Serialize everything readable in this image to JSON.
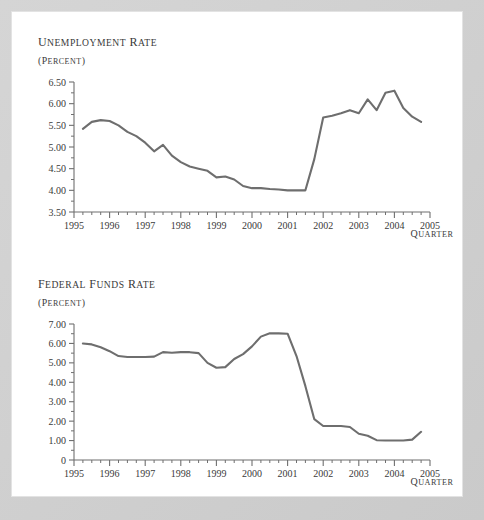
{
  "figure": {
    "background_color": "#cfcfcf",
    "sheet_color": "#ffffff",
    "line_color": "#6e6e6e",
    "axis_color": "#6f6f6f",
    "text_color": "#3a3a3a"
  },
  "chart_data": [
    {
      "id": "unemployment",
      "type": "line",
      "title": "Unemployment rate",
      "subtitle": "(percent)",
      "xlabel": "Quarter",
      "ylabel": "",
      "ylim": [
        3.5,
        6.5
      ],
      "xlim": [
        1995.25,
        2005.0
      ],
      "grid": false,
      "legend": "none",
      "ytick_labels": [
        "6.50",
        "6.00",
        "5.50",
        "5.00",
        "4.50",
        "4.00",
        "3.50"
      ],
      "ytick_values": [
        6.5,
        6.0,
        5.5,
        5.0,
        4.5,
        4.0,
        3.5
      ],
      "ytick_minor_step": 0.25,
      "xtick_labels": [
        "1995",
        "1996",
        "1997",
        "1998",
        "1999",
        "2000",
        "2001",
        "2002",
        "2003",
        "2004",
        "2005"
      ],
      "xtick_values": [
        1995,
        1996,
        1997,
        1998,
        1999,
        2000,
        2001,
        2002,
        2003,
        2004,
        2005
      ],
      "xtick_minor_step": 0.25,
      "x": [
        1995.25,
        1995.5,
        1995.75,
        1996.0,
        1996.25,
        1996.5,
        1996.75,
        1997.0,
        1997.25,
        1997.5,
        1997.75,
        1998.0,
        1998.25,
        1998.5,
        1998.75,
        1999.0,
        1999.25,
        1999.5,
        1999.75,
        2000.0,
        2000.25,
        2000.5,
        2000.75,
        2001.0,
        2001.25,
        2001.5,
        2001.75,
        2002.0,
        2002.25,
        2002.5,
        2002.75,
        2003.0,
        2003.25,
        2003.5,
        2003.75,
        2004.0,
        2004.25,
        2004.5,
        2004.75
      ],
      "values": [
        5.42,
        5.58,
        5.62,
        5.6,
        5.5,
        5.35,
        5.25,
        5.1,
        4.9,
        5.05,
        4.8,
        4.65,
        4.55,
        4.5,
        4.45,
        4.3,
        4.32,
        4.25,
        4.1,
        4.05,
        4.05,
        4.03,
        4.02,
        4.0,
        4.0,
        4.0,
        4.72,
        5.68,
        5.72,
        5.78,
        5.85,
        5.78,
        6.1,
        5.85,
        6.25,
        6.3,
        5.9,
        5.7,
        5.58,
        5.5,
        5.42,
        5.4
      ]
    },
    {
      "id": "fedfunds",
      "type": "line",
      "title": "Federal funds rate",
      "subtitle": "(percent)",
      "xlabel": "Quarter",
      "ylabel": "",
      "ylim": [
        0,
        7.0
      ],
      "xlim": [
        1995.25,
        2005.0
      ],
      "grid": false,
      "legend": "none",
      "ytick_labels": [
        "7.00",
        "6.00",
        "5.00",
        "4.00",
        "3.00",
        "2.00",
        "1.00",
        "0"
      ],
      "ytick_values": [
        7.0,
        6.0,
        5.0,
        4.0,
        3.0,
        2.0,
        1.0,
        0
      ],
      "ytick_minor_step": 0.5,
      "xtick_labels": [
        "1995",
        "1996",
        "1997",
        "1998",
        "1999",
        "2000",
        "2001",
        "2002",
        "2003",
        "2004",
        "2005"
      ],
      "xtick_values": [
        1995,
        1996,
        1997,
        1998,
        1999,
        2000,
        2001,
        2002,
        2003,
        2004,
        2005
      ],
      "xtick_minor_step": 0.25,
      "x": [
        1995.25,
        1995.5,
        1995.75,
        1996.0,
        1996.25,
        1996.5,
        1996.75,
        1997.0,
        1997.25,
        1997.5,
        1997.75,
        1998.0,
        1998.25,
        1998.5,
        1998.75,
        1999.0,
        1999.25,
        1999.5,
        1999.75,
        2000.0,
        2000.25,
        2000.5,
        2000.75,
        2001.0,
        2001.25,
        2001.5,
        2001.75,
        2002.0,
        2002.25,
        2002.5,
        2002.75,
        2003.0,
        2003.25,
        2003.5,
        2003.75,
        2004.0,
        2004.25,
        2004.5,
        2004.75
      ],
      "values": [
        6.0,
        5.95,
        5.8,
        5.6,
        5.35,
        5.3,
        5.3,
        5.3,
        5.32,
        5.55,
        5.52,
        5.55,
        5.55,
        5.5,
        5.0,
        4.75,
        4.78,
        5.2,
        5.45,
        5.85,
        6.35,
        6.52,
        6.52,
        6.5,
        5.35,
        3.8,
        2.1,
        1.75,
        1.75,
        1.75,
        1.7,
        1.35,
        1.25,
        1.02,
        1.0,
        1.0,
        1.0,
        1.05,
        1.45,
        2.1
      ]
    }
  ]
}
